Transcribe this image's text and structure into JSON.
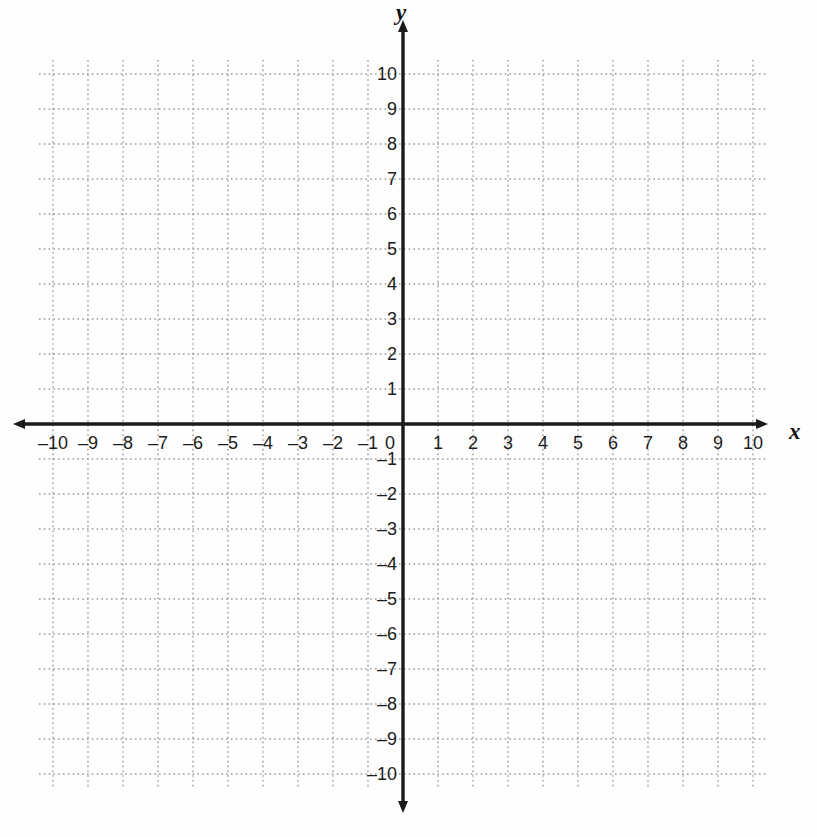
{
  "chart_data": {
    "type": "scatter",
    "title": "",
    "subtitle": "",
    "xlabel": "x",
    "ylabel": "y",
    "xlim": [
      -10,
      10
    ],
    "ylim": [
      -10,
      10
    ],
    "grid": true,
    "grid_step": 1,
    "legend": null,
    "series": [],
    "x_tick_labels": [
      "–10",
      "–9",
      "–8",
      "–7",
      "–6",
      "–5",
      "–4",
      "–3",
      "–2",
      "–1",
      "1",
      "2",
      "3",
      "4",
      "5",
      "6",
      "7",
      "8",
      "9",
      "10"
    ],
    "x_tick_values": [
      -10,
      -9,
      -8,
      -7,
      -6,
      -5,
      -4,
      -3,
      -2,
      -1,
      1,
      2,
      3,
      4,
      5,
      6,
      7,
      8,
      9,
      10
    ],
    "y_tick_labels": [
      "10",
      "9",
      "8",
      "7",
      "6",
      "5",
      "4",
      "3",
      "2",
      "1",
      "–1",
      "–2",
      "–3",
      "–4",
      "–5",
      "–6",
      "–7",
      "–8",
      "–9",
      "–10"
    ],
    "y_tick_values": [
      10,
      9,
      8,
      7,
      6,
      5,
      4,
      3,
      2,
      1,
      -1,
      -2,
      -3,
      -4,
      -5,
      -6,
      -7,
      -8,
      -9,
      -10
    ],
    "origin_label": "0",
    "annotations": []
  },
  "axes": {
    "x_axis_name": "x",
    "y_axis_name": "y",
    "origin_label": "0"
  },
  "colors": {
    "background": "#fefefe",
    "axis": "#1a1a1a",
    "gridline": "#9a9a9a",
    "label_text": "#1c1c1c"
  },
  "geometry": {
    "origin_x": 403,
    "origin_y": 424,
    "step": 35,
    "grid_min": -10,
    "grid_max": 10
  }
}
